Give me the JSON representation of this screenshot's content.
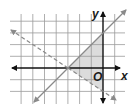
{
  "diagram": {
    "type": "coordinate-plane-inequality-graph",
    "axes": {
      "x_label": "x",
      "y_label": "y",
      "origin_label": "O",
      "x_range": [
        -8,
        2
      ],
      "y_range": [
        -4,
        5
      ]
    },
    "grid": {
      "x_min": -7,
      "x_max": 1,
      "y_min": -3,
      "y_max": 4,
      "color": "#9a9a9a"
    },
    "lines": [
      {
        "name": "solid-boundary",
        "style": "solid",
        "equation": "y = x + 3",
        "from": [
          -6,
          -3
        ],
        "to": [
          2,
          5
        ],
        "color": "#8a8a8a"
      },
      {
        "name": "dashed-boundary",
        "style": "dashed",
        "equation": "y = -2/3 x - 2",
        "from": [
          -8,
          3.33
        ],
        "to": [
          2,
          -3.33
        ],
        "color": "#8a8a8a"
      }
    ],
    "shaded_region": {
      "vertices": [
        [
          -3,
          0
        ],
        [
          0,
          3
        ],
        [
          0,
          -2
        ]
      ],
      "color": "#dcdcdc"
    },
    "colors": {
      "axis": "#111111",
      "background": "#ffffff"
    }
  }
}
